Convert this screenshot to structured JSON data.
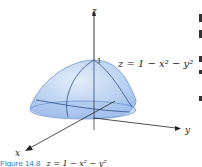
{
  "figure": {
    "axes": {
      "z_label": "z",
      "x_label": "x",
      "y_label": "y",
      "apex_tick": "1"
    },
    "equation_label": "z = 1 − x² − y²",
    "caption": {
      "figure_number": "Figure 14.8",
      "equation": "z = 1 − x² − y²"
    },
    "colors": {
      "surface_fill": "#a9c6ee",
      "surface_light": "#dbe8f8",
      "surface_edge": "#6e95d2",
      "grid_lines": "#2d4f8a",
      "axis": "#222222",
      "caption_blue": "#2a7fc4"
    }
  }
}
